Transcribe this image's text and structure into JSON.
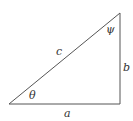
{
  "diagram": {
    "type": "right-triangle",
    "colors": {
      "stroke": "#555555",
      "text": "#333333",
      "background": "#ffffff"
    },
    "vertices": {
      "bottom_left": [
        9,
        104
      ],
      "bottom_right": [
        120,
        104
      ],
      "top_right": [
        120,
        13
      ]
    },
    "sides": {
      "hypotenuse": "c",
      "vertical": "b",
      "horizontal": "a"
    },
    "angles": {
      "bottom_left": "θ",
      "top_right": "ψ"
    }
  }
}
